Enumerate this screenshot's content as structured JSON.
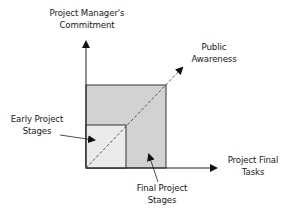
{
  "diagram": {
    "y_axis_label": [
      "Project Manager's",
      "Commitment"
    ],
    "x_axis_label": [
      "Project Final",
      "Tasks"
    ],
    "diagonal_label": [
      "Public",
      "Awareness"
    ],
    "early_label": [
      "Early Project",
      "Stages"
    ],
    "final_label": [
      "Final Project",
      "Stages"
    ],
    "colors": {
      "outer_fill": "#d2d2d2",
      "inner_fill": "#ebebeb",
      "line": "#222222",
      "dash": "#555555"
    }
  }
}
